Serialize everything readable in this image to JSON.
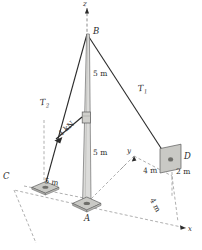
{
  "figure": {
    "axes": {
      "z": "z",
      "y": "y",
      "x": "x"
    },
    "points": {
      "A": "A",
      "B": "B",
      "C": "C",
      "D": "D"
    },
    "tensions": {
      "t1_label": "T",
      "t1_sub": "1",
      "t2_label": "T",
      "t2_sub": "2"
    },
    "dimensions": {
      "pole_upper": "5 m",
      "pole_lower": "5 m",
      "c_offset": "5 m",
      "d_height": "2 m",
      "y_offset": "4 m",
      "x_offset": "4 m"
    },
    "load": {
      "force": "4 kN"
    },
    "colors": {
      "line": "#2b2b2b",
      "pole_fill": "#d8d8d6",
      "pole_edge": "#6f6f6f",
      "plate_fill": "#c9c9c5",
      "plate_edge": "#5a5a5a",
      "dash": "#8c8c8c",
      "wall_fill": "#c4c4c0",
      "background": "#ffffff"
    }
  }
}
